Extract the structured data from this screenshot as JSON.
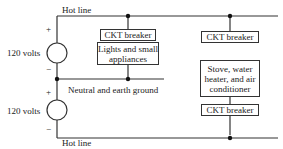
{
  "labels": {
    "hot_line_top": "Hot line",
    "hot_line_bottom": "Hot line",
    "neutral": "Neutral and earth ground",
    "source_top_voltage": "120 volts",
    "source_bottom_voltage": "120 volts",
    "plus_top": "+",
    "minus_top": "−",
    "plus_bottom": "+",
    "minus_bottom": "−"
  },
  "boxes": {
    "breaker_left": "CKT breaker",
    "load_left": "Lights and small appliances",
    "breaker_right_top": "CKT breaker",
    "load_right": "Stove, water heater, and air conditioner",
    "breaker_right_bottom": "CKT breaker"
  }
}
